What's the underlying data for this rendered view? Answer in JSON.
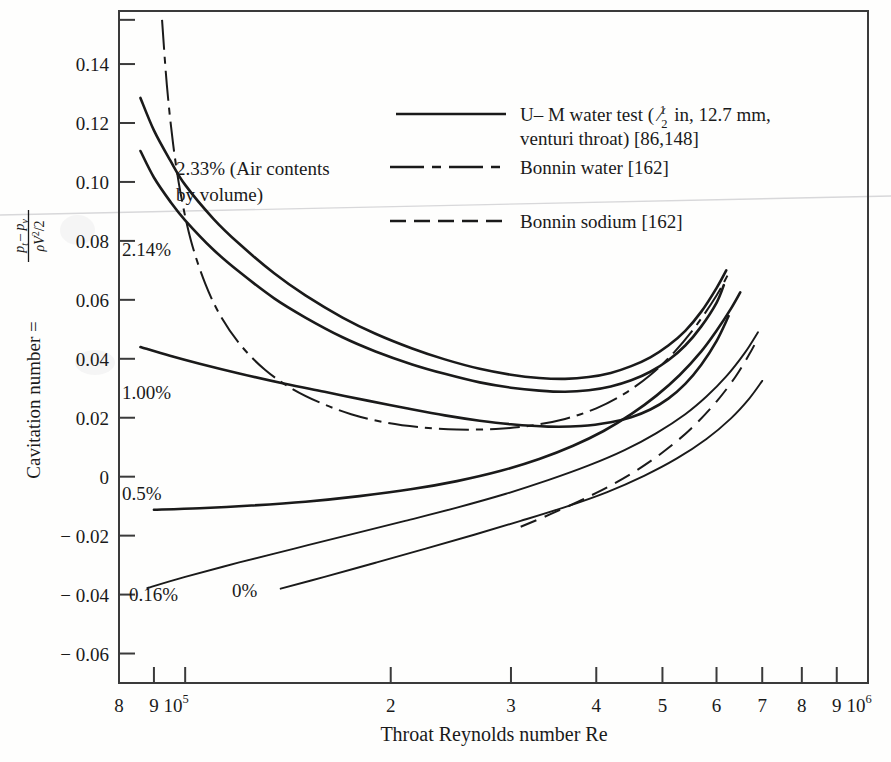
{
  "chart_data": {
    "type": "line",
    "title": "",
    "xlabel": "Throat Reynolds number Re",
    "ylabel": "Cavitation number = (p_t - p_v) / (ρV²/2)",
    "xscale": "log",
    "xlim": [
      80000,
      1000000
    ],
    "ylim": [
      -0.07,
      0.158
    ],
    "grid": false,
    "legend_position": "upper-right-inside",
    "xticks": [
      {
        "value": 80000,
        "label": "8",
        "exp": ""
      },
      {
        "value": 90000,
        "label": "9",
        "exp": ""
      },
      {
        "value": 100000,
        "label": "10",
        "exp": "5"
      },
      {
        "value": 200000,
        "label": "2",
        "exp": ""
      },
      {
        "value": 300000,
        "label": "3",
        "exp": ""
      },
      {
        "value": 400000,
        "label": "4",
        "exp": ""
      },
      {
        "value": 500000,
        "label": "5",
        "exp": ""
      },
      {
        "value": 600000,
        "label": "6",
        "exp": ""
      },
      {
        "value": 700000,
        "label": "7",
        "exp": ""
      },
      {
        "value": 800000,
        "label": "8",
        "exp": ""
      },
      {
        "value": 900000,
        "label": "9",
        "exp": ""
      },
      {
        "value": 1000000,
        "label": "10",
        "exp": "6"
      }
    ],
    "yticks": [
      {
        "value": 0.14,
        "label": "0.14"
      },
      {
        "value": 0.12,
        "label": "0.12"
      },
      {
        "value": 0.1,
        "label": "0.10"
      },
      {
        "value": 0.08,
        "label": "0.08"
      },
      {
        "value": 0.06,
        "label": "0.06"
      },
      {
        "value": 0.04,
        "label": "0.04"
      },
      {
        "value": 0.02,
        "label": "0.02"
      },
      {
        "value": 0.0,
        "label": "0"
      },
      {
        "value": -0.02,
        "label": "− 0.02"
      },
      {
        "value": -0.04,
        "label": "− 0.04"
      },
      {
        "value": -0.06,
        "label": "− 0.06"
      }
    ],
    "yticks_minor": [
      0.155
    ],
    "series": [
      {
        "name": "2.33% air content (U-M water test)",
        "style": "solid",
        "label": "2.33% (Air contents by volume)",
        "points": [
          [
            86000,
            0.1285
          ],
          [
            90000,
            0.1175
          ],
          [
            95000,
            0.1075
          ],
          [
            100000,
            0.099
          ],
          [
            110000,
            0.0875
          ],
          [
            120000,
            0.079
          ],
          [
            135000,
            0.069
          ],
          [
            150000,
            0.0615
          ],
          [
            170000,
            0.054
          ],
          [
            190000,
            0.0485
          ],
          [
            215000,
            0.0435
          ],
          [
            240000,
            0.0398
          ],
          [
            270000,
            0.0366
          ],
          [
            300000,
            0.0346
          ],
          [
            330000,
            0.0335
          ],
          [
            360000,
            0.0332
          ],
          [
            390000,
            0.0338
          ],
          [
            420000,
            0.0352
          ],
          [
            450000,
            0.0375
          ],
          [
            480000,
            0.0405
          ],
          [
            510000,
            0.0445
          ],
          [
            540000,
            0.0495
          ],
          [
            570000,
            0.056
          ],
          [
            600000,
            0.064
          ],
          [
            620000,
            0.07
          ]
        ]
      },
      {
        "name": "2.14% air content (U-M water test)",
        "style": "solid",
        "label": "2.14%",
        "points": [
          [
            86000,
            0.1105
          ],
          [
            90000,
            0.1015
          ],
          [
            95000,
            0.0935
          ],
          [
            100000,
            0.087
          ],
          [
            110000,
            0.077
          ],
          [
            120000,
            0.0695
          ],
          [
            135000,
            0.0605
          ],
          [
            150000,
            0.054
          ],
          [
            170000,
            0.0473
          ],
          [
            190000,
            0.0425
          ],
          [
            215000,
            0.0381
          ],
          [
            240000,
            0.0349
          ],
          [
            270000,
            0.032
          ],
          [
            300000,
            0.0302
          ],
          [
            330000,
            0.0292
          ],
          [
            360000,
            0.0288
          ],
          [
            390000,
            0.0293
          ],
          [
            420000,
            0.0306
          ],
          [
            450000,
            0.0327
          ],
          [
            480000,
            0.0356
          ],
          [
            510000,
            0.0395
          ],
          [
            540000,
            0.0445
          ],
          [
            570000,
            0.051
          ],
          [
            600000,
            0.059
          ],
          [
            615000,
            0.065
          ]
        ]
      },
      {
        "name": "1.00% air content (U-M water test)",
        "style": "solid",
        "label": "1.00%",
        "points": [
          [
            86000,
            0.044
          ],
          [
            95000,
            0.041
          ],
          [
            105000,
            0.0383
          ],
          [
            120000,
            0.035
          ],
          [
            140000,
            0.0315
          ],
          [
            160000,
            0.0288
          ],
          [
            185000,
            0.0258
          ],
          [
            210000,
            0.0233
          ],
          [
            240000,
            0.0208
          ],
          [
            270000,
            0.019
          ],
          [
            300000,
            0.0178
          ],
          [
            340000,
            0.017
          ],
          [
            380000,
            0.0172
          ],
          [
            420000,
            0.0185
          ],
          [
            450000,
            0.0202
          ],
          [
            480000,
            0.0228
          ],
          [
            510000,
            0.0265
          ],
          [
            540000,
            0.0315
          ],
          [
            570000,
            0.038
          ],
          [
            600000,
            0.046
          ],
          [
            625000,
            0.0545
          ]
        ]
      },
      {
        "name": "0.5% air content (U-M water test)",
        "style": "solid",
        "label": "0.5%",
        "points": [
          [
            90000,
            -0.0112
          ],
          [
            105000,
            -0.0107
          ],
          [
            125000,
            -0.0098
          ],
          [
            150000,
            -0.0085
          ],
          [
            180000,
            -0.0066
          ],
          [
            215000,
            -0.0042
          ],
          [
            250000,
            -0.0015
          ],
          [
            290000,
            0.002
          ],
          [
            330000,
            0.006
          ],
          [
            370000,
            0.0105
          ],
          [
            410000,
            0.0155
          ],
          [
            450000,
            0.0212
          ],
          [
            490000,
            0.0275
          ],
          [
            530000,
            0.0345
          ],
          [
            570000,
            0.0425
          ],
          [
            600000,
            0.0495
          ],
          [
            630000,
            0.057
          ],
          [
            650000,
            0.0625
          ]
        ]
      },
      {
        "name": "0.16% air content (U-M water test)",
        "style": "solid",
        "label": "0.16%",
        "points": [
          [
            88000,
            -0.0378
          ],
          [
            100000,
            -0.034
          ],
          [
            120000,
            -0.0291
          ],
          [
            145000,
            -0.0243
          ],
          [
            175000,
            -0.0196
          ],
          [
            210000,
            -0.015
          ],
          [
            250000,
            -0.0105
          ],
          [
            295000,
            -0.0058
          ],
          [
            340000,
            -0.0012
          ],
          [
            390000,
            0.0038
          ],
          [
            440000,
            0.009
          ],
          [
            490000,
            0.0148
          ],
          [
            540000,
            0.0212
          ],
          [
            580000,
            0.0272
          ],
          [
            620000,
            0.034
          ],
          [
            660000,
            0.042
          ],
          [
            690000,
            0.049
          ]
        ]
      },
      {
        "name": "0% air content (U-M water test)",
        "style": "solid",
        "label": "0%",
        "points": [
          [
            138000,
            -0.038
          ],
          [
            160000,
            -0.034
          ],
          [
            190000,
            -0.0292
          ],
          [
            225000,
            -0.0244
          ],
          [
            265000,
            -0.0197
          ],
          [
            310000,
            -0.015
          ],
          [
            360000,
            -0.0103
          ],
          [
            415000,
            -0.0052
          ],
          [
            470000,
            0.0003
          ],
          [
            525000,
            0.0062
          ],
          [
            580000,
            0.0128
          ],
          [
            630000,
            0.0198
          ],
          [
            670000,
            0.0265
          ],
          [
            700000,
            0.0325
          ]
        ]
      },
      {
        "name": "Bonnin water",
        "style": "dash-dot",
        "label": "Bonnin water [162]",
        "points": [
          [
            92500,
            0.155
          ],
          [
            94000,
            0.133
          ],
          [
            96000,
            0.113
          ],
          [
            98500,
            0.096
          ],
          [
            102000,
            0.08
          ],
          [
            107000,
            0.0655
          ],
          [
            113000,
            0.054
          ],
          [
            121000,
            0.0442
          ],
          [
            131000,
            0.0362
          ],
          [
            143000,
            0.03
          ],
          [
            158000,
            0.025
          ],
          [
            175000,
            0.0212
          ],
          [
            196000,
            0.0184
          ],
          [
            220000,
            0.0168
          ],
          [
            250000,
            0.016
          ],
          [
            285000,
            0.0162
          ],
          [
            320000,
            0.0173
          ],
          [
            360000,
            0.0196
          ],
          [
            400000,
            0.0232
          ],
          [
            440000,
            0.0282
          ],
          [
            480000,
            0.0345
          ],
          [
            520000,
            0.0422
          ],
          [
            560000,
            0.0512
          ],
          [
            600000,
            0.0615
          ],
          [
            625000,
            0.069
          ]
        ]
      },
      {
        "name": "Bonnin sodium",
        "style": "dashed",
        "label": "Bonnin sodium [162]",
        "points": [
          [
            310000,
            -0.017
          ],
          [
            350000,
            -0.0118
          ],
          [
            400000,
            -0.0055
          ],
          [
            450000,
            0.001
          ],
          [
            500000,
            0.0082
          ],
          [
            550000,
            0.0162
          ],
          [
            600000,
            0.0255
          ],
          [
            640000,
            0.034
          ],
          [
            670000,
            0.0415
          ],
          [
            690000,
            0.047
          ]
        ]
      }
    ],
    "annotations": [
      {
        "id": "a233",
        "text": "2.33% (Air contents",
        "x_px": 176,
        "y_px": 175
      },
      {
        "id": "a233b",
        "text": "by volume)",
        "x_px": 176,
        "y_px": 201
      },
      {
        "id": "a214",
        "text": "2.14%",
        "x_px": 122,
        "y_px": 256
      },
      {
        "id": "a100",
        "text": "1.00%",
        "x_px": 122,
        "y_px": 399
      },
      {
        "id": "a05",
        "text": "0.5%",
        "x_px": 122,
        "y_px": 500
      },
      {
        "id": "a016",
        "text": "0.16%",
        "x_px": 129,
        "y_px": 601
      },
      {
        "id": "a0",
        "text": "0%",
        "x_px": 232,
        "y_px": 597
      }
    ],
    "legend": [
      {
        "style": "solid",
        "line1": "U– M water test ( ",
        "frac_n": "1",
        "frac_d": "2",
        "line1b": " in, 12.7 mm,",
        "line2": "venturi throat) [86,148]"
      },
      {
        "style": "dash-dot",
        "line1": "Bonnin water  [162]",
        "frac_n": "",
        "frac_d": "",
        "line1b": "",
        "line2": ""
      },
      {
        "style": "dashed",
        "line1": "Bonnin sodium [162]",
        "frac_n": "",
        "frac_d": "",
        "line1b": "",
        "line2": ""
      }
    ]
  },
  "axis_label_parts": {
    "ylabel_prefix": "Cavitation number =",
    "ylabel_num": "p",
    "ylabel_num_sub": "t",
    "ylabel_num_minus": "– p",
    "ylabel_num_sub2": "v",
    "ylabel_den": "ρV",
    "ylabel_den_sup": "2",
    "ylabel_den_tail": "/2"
  }
}
